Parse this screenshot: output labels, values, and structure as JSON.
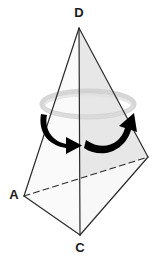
{
  "figure": {
    "type": "geometric-diagram",
    "background_color": "#ffffff",
    "width": 162,
    "height": 263
  },
  "labels": {
    "apex": "D",
    "left": "A",
    "bottom": "C"
  },
  "label_positions": {
    "apex": {
      "x": 79,
      "y": 14
    },
    "left": {
      "x": 15,
      "y": 196
    },
    "bottom": {
      "x": 80,
      "y": 248
    }
  },
  "vertices": {
    "D": {
      "x": 79,
      "y": 28,
      "labeled": true
    },
    "A": {
      "x": 24,
      "y": 196,
      "labeled": true
    },
    "C": {
      "x": 80,
      "y": 235,
      "labeled": true
    },
    "B": {
      "x": 148,
      "y": 157,
      "labeled": false
    }
  },
  "edges": [
    {
      "name": "edge-D-A",
      "from": "D",
      "to": "A",
      "style": "solid"
    },
    {
      "name": "edge-D-B",
      "from": "D",
      "to": "B",
      "style": "solid"
    },
    {
      "name": "edge-D-C",
      "from": "D",
      "to": "C",
      "style": "solid"
    },
    {
      "name": "edge-A-C",
      "from": "A",
      "to": "C",
      "style": "solid"
    },
    {
      "name": "edge-C-B",
      "from": "C",
      "to": "B",
      "style": "solid"
    },
    {
      "name": "edge-A-B",
      "from": "A",
      "to": "B",
      "style": "dashed"
    }
  ],
  "faces": [
    {
      "name": "face-D-A-C",
      "points": "79,28 24,196 80,235",
      "fill": "#fbfbfb"
    },
    {
      "name": "face-D-C-B",
      "points": "79,28 80,235 148,157",
      "fill": "#ececec"
    },
    {
      "name": "face-A-C-B",
      "points": "24,196 80,235 148,157",
      "fill": "#f7f7f7"
    },
    {
      "name": "face-D-A-B",
      "points": "79,28 24,196 148,157",
      "fill": "#e6e6e6"
    }
  ],
  "rotation_ring": {
    "name": "rotation-ring-ellipse",
    "center_x": 88,
    "center_y": 104,
    "rx": 46,
    "ry": 13,
    "stroke": "#c9c9c9",
    "stroke_width": 5
  },
  "arrows": {
    "color": "#000000",
    "left_arrow": {
      "name": "rotation-arrow-left",
      "description": "curved arrow sweeping from upper-left downward to the right, arrowhead pointing right"
    },
    "right_arrow": {
      "name": "rotation-arrow-right",
      "description": "curved arrow sweeping from lower-left rightward then upward, arrowhead pointing up-right"
    }
  },
  "colors": {
    "stroke": "#2b2b2b",
    "face_light": "#fbfbfb",
    "face_mid": "#f0f0f0",
    "face_dark": "#e4e4e4",
    "arrow": "#000000",
    "label": "#1a1a1a",
    "ring": "#c9c9c9"
  }
}
